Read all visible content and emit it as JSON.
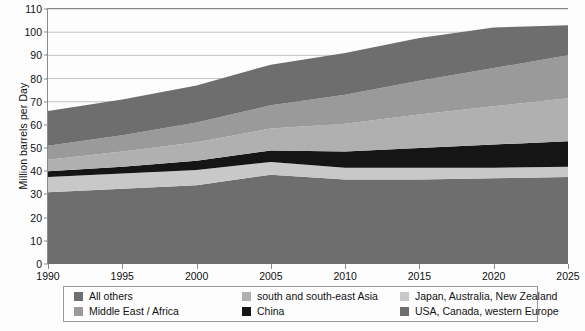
{
  "chart_data": {
    "type": "area",
    "title": "",
    "subtitle": "",
    "xlabel": "",
    "ylabel": "Million barrels per Day",
    "xlim": [
      1990,
      2025
    ],
    "ylim": [
      0,
      110
    ],
    "grid": true,
    "stacked": true,
    "legend_position": "bottom",
    "x": [
      1990,
      1995,
      2000,
      2005,
      2010,
      2015,
      2020,
      2025
    ],
    "xticks": [
      "1990",
      "1995",
      "2000",
      "2005",
      "2010",
      "2015",
      "2020",
      "2025"
    ],
    "yticks": [
      "0",
      "10",
      "20",
      "30",
      "40",
      "50",
      "60",
      "70",
      "80",
      "90",
      "100",
      "110"
    ],
    "series": [
      {
        "name": "USA, Canada, western Europe",
        "color": "#6e6e6e",
        "values": [
          31.0,
          32.5,
          34.0,
          38.5,
          36.5,
          36.5,
          37.0,
          37.5
        ]
      },
      {
        "name": "Japan, Australia, New Zealand",
        "color": "#c8c8c8",
        "values": [
          6.5,
          6.5,
          6.5,
          5.5,
          5.0,
          5.0,
          4.5,
          4.5
        ]
      },
      {
        "name": "China",
        "color": "#151515",
        "values": [
          2.5,
          3.0,
          4.0,
          5.0,
          7.0,
          8.5,
          10.0,
          11.0
        ]
      },
      {
        "name": "south and south-east Asia",
        "color": "#b0b0b0",
        "values": [
          5.0,
          6.5,
          8.0,
          9.5,
          12.0,
          14.5,
          16.5,
          18.5
        ]
      },
      {
        "name": "Middle East / Africa",
        "color": "#9a9a9a",
        "values": [
          6.0,
          7.0,
          8.5,
          10.0,
          12.5,
          14.5,
          16.5,
          18.5
        ]
      },
      {
        "name": "All others",
        "color": "#6e6e6e",
        "values": [
          15.0,
          15.5,
          16.0,
          17.5,
          18.0,
          18.5,
          17.5,
          13.0
        ]
      }
    ],
    "stack_order_bottom_to_top": [
      "USA, Canada, western Europe",
      "Japan, Australia, New Zealand",
      "China",
      "south and south-east Asia",
      "Middle East / Africa",
      "All others"
    ],
    "totals": [
      66.0,
      71.0,
      77.0,
      86.0,
      91.0,
      97.5,
      102.0,
      103.0
    ]
  },
  "legend": {
    "entries": [
      {
        "label": "All others",
        "color": "#6e6e6e"
      },
      {
        "label": "south and south-east Asia",
        "color": "#b0b0b0"
      },
      {
        "label": "Japan, Australia, New Zealand",
        "color": "#c8c8c8"
      },
      {
        "label": "Middle East / Africa",
        "color": "#9a9a9a"
      },
      {
        "label": "China",
        "color": "#151515"
      },
      {
        "label": "USA, Canada, western Europe",
        "color": "#6e6e6e"
      }
    ]
  },
  "axes": {
    "y_title": "Million barrels per Day",
    "grid_color": "#b5b5b5",
    "axis_color": "#8a8a8a"
  }
}
